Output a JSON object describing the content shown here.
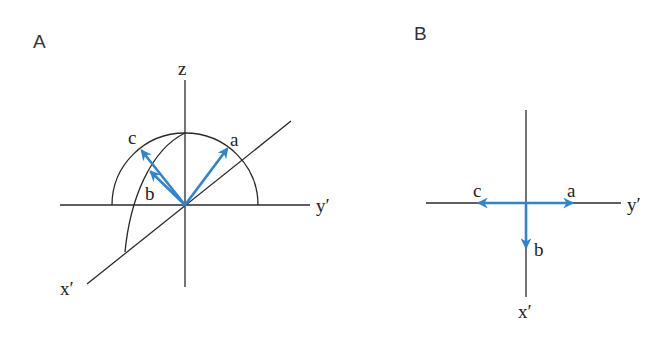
{
  "figure": {
    "colors": {
      "axis": "#2a2a2a",
      "vector": "#2f84d0",
      "text": "#222222",
      "background": "#ffffff"
    },
    "panelA": {
      "label": "A",
      "axes": {
        "z": "z",
        "y": "y′",
        "x": "x′"
      },
      "vectors": [
        {
          "id": "a",
          "label": "a"
        },
        {
          "id": "b",
          "label": "b"
        },
        {
          "id": "c",
          "label": "c"
        }
      ]
    },
    "panelB": {
      "label": "B",
      "axes": {
        "y": "y′",
        "x": "x′"
      },
      "vectors": [
        {
          "id": "a",
          "label": "a"
        },
        {
          "id": "b",
          "label": "b"
        },
        {
          "id": "c",
          "label": "c"
        }
      ]
    }
  }
}
